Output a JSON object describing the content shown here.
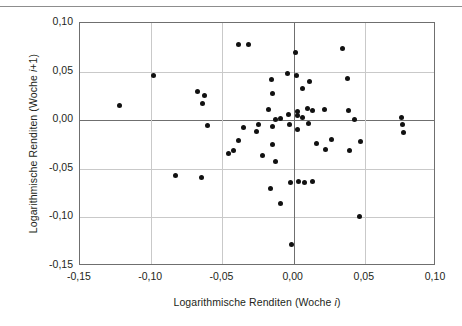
{
  "chart_data": {
    "type": "scatter",
    "title": "",
    "xlabel": "Logarithmische Renditen (Woche i)",
    "ylabel": "Logarithmische Renditen (Woche i+1)",
    "xlim": [
      -0.15,
      0.1
    ],
    "ylim": [
      -0.15,
      0.1
    ],
    "xticks": [
      "-0,15",
      "-0,10",
      "-0,05",
      "0,00",
      "0,05",
      "0,10"
    ],
    "xtick_values": [
      -0.15,
      -0.1,
      -0.05,
      0.0,
      0.05,
      0.1
    ],
    "yticks": [
      "0,10",
      "0,05",
      "0,00",
      "-0,05",
      "-0,10",
      "-0,15"
    ],
    "ytick_values": [
      0.1,
      0.05,
      0.0,
      -0.05,
      -0.1,
      -0.15
    ],
    "grid": true,
    "legend": false,
    "marker": "filled-circle",
    "marker_color": "#111111",
    "points": [
      [
        -0.1225,
        0.0155
      ],
      [
        -0.0985,
        0.046
      ],
      [
        -0.083,
        -0.0565
      ],
      [
        -0.0675,
        0.03
      ],
      [
        -0.0645,
        -0.059
      ],
      [
        -0.0625,
        0.0255
      ],
      [
        -0.064,
        0.017
      ],
      [
        -0.0605,
        -0.0055
      ],
      [
        -0.039,
        0.0775
      ],
      [
        -0.032,
        0.0775
      ],
      [
        -0.035,
        -0.008
      ],
      [
        -0.039,
        -0.0205
      ],
      [
        -0.042,
        -0.031
      ],
      [
        -0.0455,
        -0.0345
      ],
      [
        -0.025,
        -0.0045
      ],
      [
        -0.026,
        -0.012
      ],
      [
        -0.0215,
        -0.0365
      ],
      [
        -0.0175,
        0.0115
      ],
      [
        -0.015,
        -0.006
      ],
      [
        -0.0145,
        -0.025
      ],
      [
        -0.016,
        -0.07
      ],
      [
        -0.0155,
        0.042
      ],
      [
        -0.015,
        0.027
      ],
      [
        -0.013,
        0.001
      ],
      [
        -0.0125,
        -0.042
      ],
      [
        -0.0095,
        0.0015
      ],
      [
        -0.009,
        -0.0855
      ],
      [
        -0.004,
        0.048
      ],
      [
        -0.0035,
        0.006
      ],
      [
        -0.003,
        -0.0045
      ],
      [
        -0.002,
        -0.0645
      ],
      [
        -0.0015,
        -0.1275
      ],
      [
        0.0015,
        0.07
      ],
      [
        0.002,
        0.0465
      ],
      [
        0.0025,
        0.009
      ],
      [
        0.003,
        0.005
      ],
      [
        0.003,
        -0.0095
      ],
      [
        0.0035,
        -0.063
      ],
      [
        0.006,
        0.0325
      ],
      [
        0.0065,
        0.0025
      ],
      [
        0.0075,
        -0.064
      ],
      [
        0.01,
        0.012
      ],
      [
        0.0105,
        -0.003
      ],
      [
        0.0115,
        0.0395
      ],
      [
        0.013,
        0.0095
      ],
      [
        0.013,
        -0.0635
      ],
      [
        0.016,
        -0.0235
      ],
      [
        0.0215,
        0.0115
      ],
      [
        0.0225,
        -0.0305
      ],
      [
        0.0265,
        -0.0195
      ],
      [
        0.0345,
        0.074
      ],
      [
        0.0375,
        0.0425
      ],
      [
        0.0385,
        0.0095
      ],
      [
        0.0395,
        -0.031
      ],
      [
        0.043,
        0.001
      ],
      [
        0.046,
        -0.0995
      ],
      [
        0.047,
        -0.0215
      ],
      [
        0.076,
        0.0025
      ],
      [
        0.0765,
        -0.004
      ],
      [
        0.077,
        -0.013
      ]
    ]
  }
}
